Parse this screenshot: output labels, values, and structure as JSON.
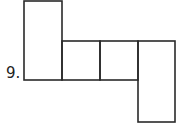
{
  "problem": {
    "number_label": "9.",
    "description": "Net of a 3D shape: row of squares with tall rectangles attached"
  },
  "shapes": {
    "stroke_color": "#2a2a2a",
    "cells": [
      {
        "id": "left-tall",
        "x": 24,
        "y": 1,
        "w": 38,
        "h": 79
      },
      {
        "id": "square-1",
        "x": 62,
        "y": 41,
        "w": 38,
        "h": 39
      },
      {
        "id": "square-2",
        "x": 100,
        "y": 41,
        "w": 38,
        "h": 39
      },
      {
        "id": "right-tall",
        "x": 138,
        "y": 41,
        "w": 37,
        "h": 81
      }
    ]
  }
}
